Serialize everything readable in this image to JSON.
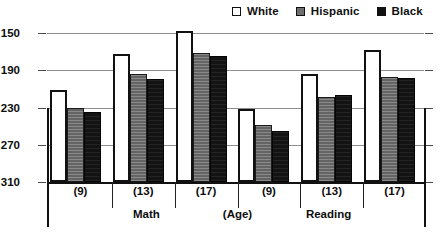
{
  "chart_data": {
    "type": "bar",
    "title": "",
    "xlabel": "(Age)",
    "ylabel": "",
    "ylim": [
      150,
      310
    ],
    "yticks": [
      150,
      190,
      230,
      270,
      310
    ],
    "grid": true,
    "legend_position": "top-right",
    "categories": [
      "(9)",
      "(13)",
      "(17)",
      "(9)",
      "(13)",
      "(17)"
    ],
    "group_sections": [
      "Math",
      "(Age)",
      "Reading"
    ],
    "sections": [
      {
        "name": "Math",
        "categories": [
          "(9)",
          "(13)",
          "(17)"
        ]
      },
      {
        "name": "Reading",
        "categories": [
          "(9)",
          "(13)",
          "(17)"
        ]
      }
    ],
    "series": [
      {
        "name": "White",
        "color": "#ffffff",
        "values": [
          249,
          288,
          312,
          228,
          266,
          292
        ]
      },
      {
        "name": "Hispanic",
        "color": "#6f6f6f",
        "values": [
          230,
          266,
          289,
          211,
          241,
          263
        ]
      },
      {
        "name": "Black",
        "color": "#131313",
        "values": [
          225,
          261,
          285,
          205,
          243,
          262
        ]
      }
    ]
  },
  "legend": {
    "items": [
      {
        "label": "White",
        "swatch": "white-square-icon"
      },
      {
        "label": "Hispanic",
        "swatch": "gray-square-icon"
      },
      {
        "label": "Black",
        "swatch": "black-square-icon"
      }
    ]
  },
  "yaxis": {
    "ticks": [
      "310",
      "270",
      "230",
      "190",
      "150"
    ]
  },
  "xaxis": {
    "category_labels": [
      "(9)",
      "(13)",
      "(17)",
      "(9)",
      "(13)",
      "(17)"
    ],
    "section_labels": [
      "Math",
      "(Age)",
      "Reading"
    ]
  },
  "caption": {
    "text": ""
  }
}
